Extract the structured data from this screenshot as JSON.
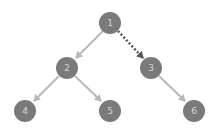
{
  "diagram": {
    "type": "binary-tree",
    "colors": {
      "node_fill": "#7a7a7a",
      "node_label": "#d8d8d8",
      "edge": "#b8b8b8",
      "dotted_edge": "#555555",
      "background": "#ffffff"
    },
    "nodes": [
      {
        "id": "1",
        "label": "1",
        "x": 110,
        "y": 23
      },
      {
        "id": "2",
        "label": "2",
        "x": 67,
        "y": 68
      },
      {
        "id": "3",
        "label": "3",
        "x": 151,
        "y": 68
      },
      {
        "id": "4",
        "label": "4",
        "x": 25,
        "y": 111
      },
      {
        "id": "5",
        "label": "5",
        "x": 110,
        "y": 111
      },
      {
        "id": "6",
        "label": "6",
        "x": 194,
        "y": 111
      }
    ],
    "edges": [
      {
        "from": "1",
        "to": "2",
        "style": "solid"
      },
      {
        "from": "1",
        "to": "3",
        "style": "dotted"
      },
      {
        "from": "2",
        "to": "4",
        "style": "solid"
      },
      {
        "from": "2",
        "to": "5",
        "style": "solid"
      },
      {
        "from": "3",
        "to": "6",
        "style": "solid"
      }
    ]
  }
}
